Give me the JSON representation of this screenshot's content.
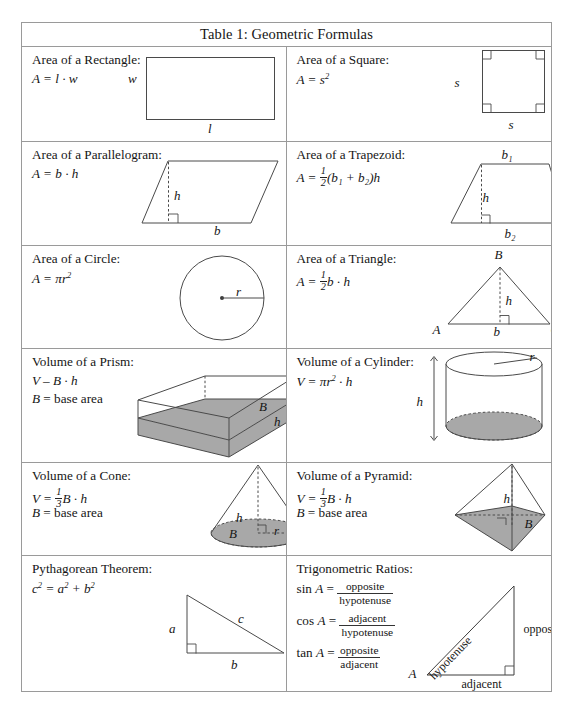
{
  "table": {
    "title": "Table 1: Geometric Formulas",
    "rows": [
      {
        "left": {
          "name": "Area of a Rectangle:",
          "formula": "A = l · w",
          "diagram": "rectangle",
          "labels": [
            "w",
            "l"
          ]
        },
        "right": {
          "name": "Area of a Square:",
          "formula_prefix": "A = s",
          "formula_exp": "2",
          "diagram": "square",
          "labels": [
            "s",
            "s"
          ]
        }
      },
      {
        "left": {
          "name": "Area of a Parallelogram:",
          "formula": "A = b · h",
          "diagram": "parallelogram",
          "labels": [
            "h",
            "b"
          ]
        },
        "right": {
          "name": "Area of a Trapezoid:",
          "formula_lead": "A =",
          "formula_frac_num": "1",
          "formula_frac_den": "2",
          "formula_tail": "(b₁ + b₂)h",
          "diagram": "trapezoid",
          "labels": [
            "b₁",
            "h",
            "b₂"
          ]
        }
      },
      {
        "left": {
          "name": "Area of a Circle:",
          "formula_prefix": "A = πr",
          "formula_exp": "2",
          "diagram": "circle",
          "labels": [
            "r"
          ]
        },
        "right": {
          "name": "Area of a Triangle:",
          "formula_lead": "A =",
          "formula_frac_num": "1",
          "formula_frac_den": "2",
          "formula_tail": "b · h",
          "diagram": "triangle",
          "labels": [
            "B",
            "h",
            "A",
            "b",
            "C"
          ]
        }
      },
      {
        "left": {
          "name": "Volume of a Prism:",
          "formula": "V – B · h",
          "formula2": "B = base area",
          "diagram": "prism",
          "labels": [
            "B",
            "h"
          ]
        },
        "right": {
          "name": "Volume of a Cylinder:",
          "formula_prefix": "V = πr",
          "formula_exp": "2",
          "formula_suffix": " · h",
          "diagram": "cylinder",
          "labels": [
            "r",
            "h"
          ]
        }
      },
      {
        "left": {
          "name": "Volume of a Cone:",
          "formula_lead": "V =",
          "formula_frac_num": "1",
          "formula_frac_den": "3",
          "formula_tail": "B · h",
          "formula2": "B = base area",
          "diagram": "cone",
          "labels": [
            "h",
            "B",
            "r"
          ]
        },
        "right": {
          "name": "Volume of a Pyramid:",
          "formula_lead": "V =",
          "formula_frac_num": "1",
          "formula_frac_den": "3",
          "formula_tail": "B · h",
          "formula2": "B = base area",
          "diagram": "pyramid",
          "labels": [
            "h",
            "B"
          ]
        }
      },
      {
        "left": {
          "name": "Pythagorean Theorem:",
          "formula_parts": [
            "c",
            "2",
            " = a",
            "2",
            " + b",
            "2"
          ],
          "diagram": "right-triangle",
          "labels": [
            "c",
            "a",
            "b"
          ]
        },
        "right": {
          "name": "Trigonometric Ratios:",
          "ratios": [
            {
              "fn": "sin A",
              "num": "opposite",
              "den": "hypotenuse"
            },
            {
              "fn": "cos A",
              "num": "adjacent",
              "den": "hypotenuse"
            },
            {
              "fn": "tan A",
              "num": "opposite",
              "den": "adjacent"
            }
          ],
          "diagram": "trig-triangle",
          "labels": [
            "hypotenuse",
            "opposite",
            "A",
            "adjacent"
          ]
        }
      }
    ]
  }
}
